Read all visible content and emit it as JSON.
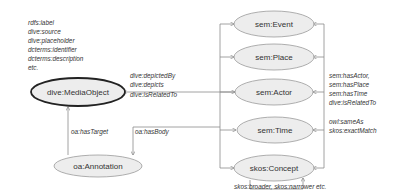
{
  "colors": {
    "node_fill": "#ededed",
    "node_stroke": "#9a9a9a",
    "main_node_stroke": "#222222",
    "edge": "#8a8a8a",
    "text": "#333333"
  },
  "properties_note": {
    "lines": [
      "rdfs:label",
      "dive:source",
      "dive:placeholder",
      "dcterms:identifier",
      "dcterms:description",
      "etc."
    ]
  },
  "nodes": {
    "media_object": "dive:MediaObject",
    "annotation": "oa:Annotation",
    "event": "sem:Event",
    "place": "sem:Place",
    "actor": "sem:Actor",
    "time": "sem:Time",
    "concept": "skos:Concept"
  },
  "edges": {
    "media_links": [
      "dive:depictedBy",
      "dive:depicts",
      "dive:isRelatedTo"
    ],
    "has_target": "oa:hasTarget",
    "has_body": "oa:hasBody",
    "entity_links": [
      "sem:hasActor,",
      "sem:hasPlace",
      "sem:hasTime",
      "dive:isRelatedTo"
    ],
    "same_links": [
      "owl:sameAs",
      "skos:exactMatch"
    ],
    "concept_links": "skos:broader, skos:narrower etc."
  }
}
